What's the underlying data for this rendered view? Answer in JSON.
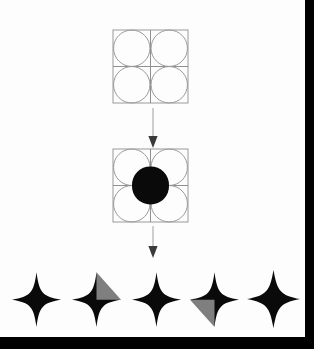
{
  "figure": {
    "background_color": "#fdfdfd",
    "frame_color": "#000000",
    "canvas_width": 314,
    "canvas_height": 349
  },
  "palette": {
    "outline_gray": "#9a9a9a",
    "grid_gray": "#8f8f8f",
    "star_black": "#0a0a0a",
    "highlight_gray": "#7f7f7f",
    "arrow_line": "#b0b0b0",
    "arrow_head": "#3a3a3a",
    "paper_white": "#fdfdfd"
  },
  "stages": [
    {
      "id": "grid-with-circles",
      "name": "2x2 square grid with inscribed circles",
      "rows": 2,
      "columns": 2,
      "circle_count": 4,
      "circles_filled": false,
      "center_star_visible": false,
      "outline_color": "#9a9a9a"
    },
    {
      "id": "grid-with-center-star",
      "name": "2x2 grid with central astroid highlighted",
      "rows": 2,
      "columns": 2,
      "circle_count": 4,
      "circles_filled": false,
      "center_star_visible": true,
      "center_star_color": "#0a0a0a",
      "outline_color": "#9a9a9a"
    }
  ],
  "arrows": [
    {
      "id": "arrow-top",
      "direction": "down",
      "label": ""
    },
    {
      "id": "arrow-bottom",
      "direction": "down",
      "label": ""
    }
  ],
  "stars": [
    {
      "index": 1,
      "name": "star-plain-1",
      "fill": "#0a0a0a",
      "highlight": null,
      "highlight_quadrant": "none",
      "concavity": 0.46,
      "size": 54
    },
    {
      "index": 2,
      "name": "star-highlight-upper-right",
      "fill": "#0a0a0a",
      "highlight": "#7f7f7f",
      "highlight_quadrant": "upper-right",
      "concavity": 0.46,
      "size": 54
    },
    {
      "index": 3,
      "name": "star-plain-2",
      "fill": "#0a0a0a",
      "highlight": null,
      "highlight_quadrant": "none",
      "concavity": 0.46,
      "size": 54
    },
    {
      "index": 4,
      "name": "star-highlight-lower-left",
      "fill": "#0a0a0a",
      "highlight": "#7f7f7f",
      "highlight_quadrant": "lower-left",
      "concavity": 0.46,
      "size": 54
    },
    {
      "index": 5,
      "name": "star-plain-3",
      "fill": "#0a0a0a",
      "highlight": null,
      "highlight_quadrant": "none",
      "concavity": 0.56,
      "size": 58
    }
  ]
}
